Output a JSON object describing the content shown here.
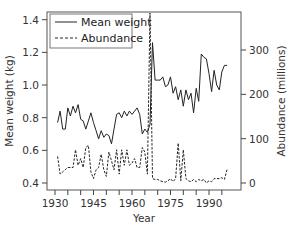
{
  "chart_data": {
    "type": "line",
    "title": "",
    "xlabel": "Year",
    "ylabel": "Mean weight (kg)",
    "y2label": "Abundance (millions)",
    "xlim": [
      1930,
      1999
    ],
    "ylim": [
      0.4,
      1.4
    ],
    "y2lim": [
      0,
      400
    ],
    "xticks": [
      1930,
      1935,
      1940,
      1945,
      1950,
      1955,
      1960,
      1965,
      1970,
      1975,
      1980,
      1985,
      1990,
      1995
    ],
    "xtick_labels": [
      "1930",
      "1945",
      "1960",
      "1975",
      "1990"
    ],
    "xtick_label_values": [
      1930,
      1945,
      1960,
      1975,
      1990
    ],
    "yticks": [
      0.4,
      0.6,
      0.8,
      1.0,
      1.2,
      1.4
    ],
    "ytick_labels": [
      "0.4",
      "0.6",
      "0.8",
      "1.0",
      "1.2",
      "1.4"
    ],
    "y2ticks": [
      0,
      100,
      200,
      300
    ],
    "y2tick_labels": [
      "0",
      "100",
      "200",
      "300"
    ],
    "legend": {
      "position": "upper left",
      "entries": [
        "Mean weight",
        "Abundance"
      ]
    },
    "grid": false,
    "x": [
      1931,
      1932,
      1933,
      1934,
      1935,
      1936,
      1937,
      1938,
      1939,
      1940,
      1941,
      1942,
      1943,
      1944,
      1945,
      1946,
      1947,
      1948,
      1949,
      1950,
      1951,
      1952,
      1953,
      1954,
      1955,
      1956,
      1957,
      1958,
      1959,
      1960,
      1961,
      1962,
      1963,
      1964,
      1965,
      1966,
      1967,
      1968,
      1969,
      1970,
      1971,
      1972,
      1973,
      1974,
      1975,
      1976,
      1977,
      1978,
      1979,
      1980,
      1981,
      1982,
      1983,
      1984,
      1985,
      1986,
      1987,
      1988,
      1989,
      1990,
      1991,
      1992,
      1993,
      1994,
      1995,
      1996,
      1997
    ],
    "series": [
      {
        "name": "Mean weight",
        "axis": "left",
        "style": "solid",
        "values": [
          0.77,
          0.84,
          0.73,
          0.73,
          0.86,
          0.81,
          0.87,
          0.83,
          0.88,
          0.79,
          0.78,
          0.73,
          0.78,
          0.83,
          0.77,
          0.72,
          0.67,
          0.72,
          0.68,
          0.7,
          0.69,
          0.64,
          0.73,
          0.82,
          0.83,
          0.8,
          0.84,
          0.81,
          0.84,
          0.82,
          0.84,
          0.86,
          0.82,
          0.7,
          0.73,
          0.71,
          0.76,
          1.26,
          1.03,
          1.03,
          1.03,
          1.05,
          0.99,
          1.0,
          1.05,
          0.95,
          0.99,
          0.91,
          0.97,
          0.87,
          0.97,
          0.91,
          0.95,
          0.83,
          0.98,
          0.9,
          1.19,
          1.17,
          1.16,
          1.07,
          0.96,
          1.09,
          1.0,
          0.97,
          1.08,
          1.12,
          1.12
        ]
      },
      {
        "name": "Abundance",
        "axis": "right",
        "style": "dashed",
        "values": [
          60,
          20,
          25,
          30,
          35,
          35,
          35,
          75,
          40,
          55,
          35,
          80,
          85,
          25,
          10,
          30,
          35,
          65,
          30,
          15,
          70,
          50,
          30,
          75,
          20,
          75,
          40,
          75,
          40,
          45,
          55,
          35,
          35,
          80,
          70,
          20,
          405,
          10,
          8,
          8,
          5,
          3,
          2,
          5,
          10,
          3,
          10,
          90,
          5,
          75,
          10,
          5,
          3,
          8,
          3,
          8,
          5,
          8,
          0,
          5,
          3,
          10,
          10,
          10,
          12,
          8,
          30
        ]
      }
    ]
  },
  "legend": {
    "mean_weight_label": "Mean weight",
    "abundance_label": "Abundance"
  },
  "axes": {
    "x_title": "Year",
    "y_left_title": "Mean weight (kg)",
    "y_right_title": "Abundance (millions)"
  },
  "colors": {
    "line": "#222222",
    "axis": "#444444",
    "text": "#333333"
  }
}
